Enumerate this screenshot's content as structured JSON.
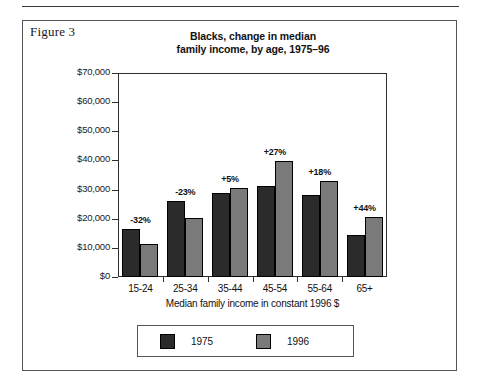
{
  "figure": {
    "label": "Figure 3"
  },
  "chart_data": {
    "type": "bar",
    "title": "Blacks, change in median family income, by age, 1975–96",
    "title_lines": [
      "Blacks, change in median",
      "family income, by age, 1975–96"
    ],
    "xlabel": "Median family income in constant 1996 $",
    "ylabel": "",
    "categories": [
      "15-24",
      "25-34",
      "35-44",
      "45-54",
      "55-64",
      "65+"
    ],
    "series": [
      {
        "name": "1975",
        "color": "#2b2b2b",
        "values": [
          16500,
          26200,
          29000,
          31300,
          28000,
          14300
        ]
      },
      {
        "name": "1996",
        "color": "#7a7a7a",
        "values": [
          11200,
          20200,
          30500,
          39800,
          33100,
          20600
        ]
      }
    ],
    "annotations": [
      "-32%",
      "-23%",
      "+5%",
      "+27%",
      "+18%",
      "+44%"
    ],
    "ylim": [
      0,
      70000
    ],
    "ytick_values": [
      0,
      10000,
      20000,
      30000,
      40000,
      50000,
      60000,
      70000
    ],
    "ytick_labels": [
      "$0",
      "$10,000",
      "$20,000",
      "$30,000",
      "$40,000",
      "$50,000",
      "$60,000",
      "$70,000"
    ],
    "grid": false,
    "legend_position": "bottom",
    "legend_entries": [
      "1975",
      "1996"
    ]
  }
}
